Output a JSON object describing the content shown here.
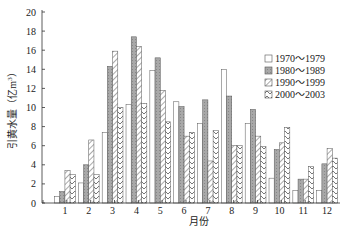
{
  "chart_data": {
    "type": "bar",
    "title": "",
    "xlabel": "月份",
    "ylabel": "引黄水量（亿m³）",
    "ylabel_main": "引黄水量（亿m",
    "ylabel_sup": "3",
    "ylabel_end": "）",
    "ylim": [
      0,
      20
    ],
    "yticks": [
      0,
      2,
      4,
      6,
      8,
      10,
      12,
      14,
      16,
      18,
      20
    ],
    "categories": [
      "1",
      "2",
      "3",
      "4",
      "5",
      "6",
      "7",
      "8",
      "9",
      "10",
      "11",
      "12"
    ],
    "grid": false,
    "legend_position": "upper right",
    "series": [
      {
        "name": "1970～1979",
        "pattern": "white",
        "values": [
          0.7,
          2.1,
          7.4,
          10.3,
          13.9,
          10.6,
          8.3,
          14.0,
          8.3,
          2.6,
          1.3,
          1.3
        ]
      },
      {
        "name": "1980～1989",
        "pattern": "gray",
        "values": [
          1.2,
          4.0,
          14.3,
          17.4,
          15.2,
          10.1,
          10.8,
          11.2,
          9.8,
          5.6,
          2.5,
          4.1
        ]
      },
      {
        "name": "1990～1999",
        "pattern": "diagonal",
        "values": [
          3.4,
          6.6,
          15.9,
          16.4,
          11.8,
          7.0,
          4.4,
          6.0,
          7.0,
          6.3,
          2.5,
          5.7
        ]
      },
      {
        "name": "2000～2003",
        "pattern": "chevron",
        "values": [
          3.0,
          3.0,
          10.0,
          10.4,
          8.5,
          7.4,
          7.6,
          6.0,
          5.9,
          7.9,
          3.8,
          4.7
        ]
      }
    ]
  }
}
